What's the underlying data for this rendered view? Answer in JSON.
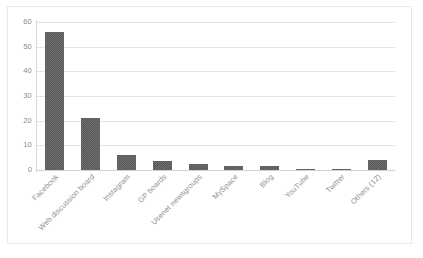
{
  "chart_data": {
    "type": "bar",
    "title": "",
    "subtitle": "",
    "xlabel": "",
    "ylabel": "",
    "ylim": [
      0,
      60
    ],
    "yticks": [
      0,
      10,
      20,
      30,
      40,
      50,
      60
    ],
    "ytick_labels": [
      "0",
      "10",
      "20",
      "30",
      "40",
      "50",
      "60"
    ],
    "grid": true,
    "legend": false,
    "legend_position": "none",
    "orientation": "vertical",
    "bar_color": "#5b5b5b",
    "gridline_color": "#e3e3e3",
    "background_color": "#ffffff",
    "categories": [
      "Facebook",
      "Web discussion board",
      "Instagram",
      "GP boards",
      "Usenet newsgroups",
      "MySpace",
      "Blog",
      "YouTube",
      "Twitter",
      "Others (12)"
    ],
    "values": [
      56,
      21,
      6,
      3.5,
      2.5,
      1.5,
      1.5,
      0.5,
      0.5,
      4
    ],
    "series": [
      {
        "name": "Count",
        "values": [
          56,
          21,
          6,
          3.5,
          2.5,
          1.5,
          1.5,
          0.5,
          0.5,
          4
        ]
      }
    ]
  }
}
